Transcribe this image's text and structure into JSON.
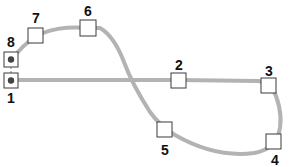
{
  "diagram": {
    "type": "track-loop-figure-eight",
    "track_color": "#b3b3b3",
    "node_stroke": "#3a3a3a",
    "dot_color": "#444444",
    "nodes": [
      {
        "id": "1",
        "label": "1",
        "x": 11,
        "y": 80,
        "has_dot": true,
        "label_x": 11,
        "label_y": 98
      },
      {
        "id": "2",
        "label": "2",
        "x": 178,
        "y": 80,
        "has_dot": false,
        "label_x": 179,
        "label_y": 65
      },
      {
        "id": "3",
        "label": "3",
        "x": 268,
        "y": 85,
        "has_dot": false,
        "label_x": 269,
        "label_y": 71
      },
      {
        "id": "4",
        "label": "4",
        "x": 273,
        "y": 141,
        "has_dot": false,
        "label_x": 275,
        "label_y": 160
      },
      {
        "id": "5",
        "label": "5",
        "x": 164,
        "y": 129,
        "has_dot": false,
        "label_x": 165,
        "label_y": 150
      },
      {
        "id": "6",
        "label": "6",
        "x": 88,
        "y": 28,
        "has_dot": false,
        "label_x": 88,
        "label_y": 11
      },
      {
        "id": "7",
        "label": "7",
        "x": 35,
        "y": 35,
        "has_dot": false,
        "label_x": 36,
        "label_y": 18
      },
      {
        "id": "8",
        "label": "8",
        "x": 11,
        "y": 59,
        "has_dot": true,
        "label_x": 11,
        "label_y": 42
      }
    ]
  }
}
